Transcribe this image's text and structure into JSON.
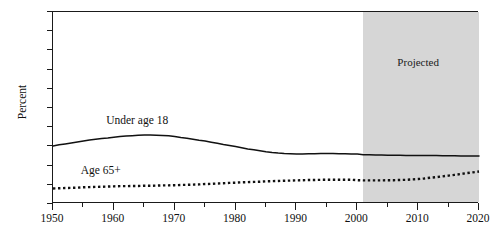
{
  "chart_data": {
    "type": "line",
    "title": "",
    "xlabel": "",
    "ylabel": "Percent",
    "xlim": [
      1950,
      2020
    ],
    "ylim": [
      0,
      100
    ],
    "grid": false,
    "legend_position": "inline-annotations",
    "xticks": [
      1950,
      1955,
      1960,
      1965,
      1970,
      1975,
      1980,
      1985,
      1990,
      1995,
      2000,
      2005,
      2010,
      2015,
      2020
    ],
    "xtick_labels": [
      "1950",
      "",
      "1960",
      "",
      "1970",
      "",
      "1980",
      "",
      "1990",
      "",
      "2000",
      "",
      "2010",
      "",
      "2020"
    ],
    "yticks": [
      0,
      10,
      20,
      30,
      40,
      50,
      60,
      70,
      80,
      90,
      100
    ],
    "ytick_labels": [
      "0",
      "10",
      "20",
      "30",
      "40",
      "50",
      "60",
      "70",
      "80",
      "90",
      "100"
    ],
    "annotations": [
      {
        "name": "projected-region",
        "label": "Projected",
        "x_start": 2001,
        "x_end": 2020,
        "label_x": 2010,
        "label_y": 74,
        "fill": "#d6d6d6"
      }
    ],
    "series": [
      {
        "name": "Under age 18",
        "style": "solid",
        "color": "#111111",
        "label_x": 1964,
        "label_y": 43,
        "x": [
          1950,
          1951,
          1952,
          1953,
          1954,
          1955,
          1956,
          1957,
          1958,
          1959,
          1960,
          1961,
          1962,
          1963,
          1964,
          1965,
          1966,
          1967,
          1968,
          1969,
          1970,
          1971,
          1972,
          1973,
          1974,
          1975,
          1976,
          1977,
          1978,
          1979,
          1980,
          1981,
          1982,
          1983,
          1984,
          1985,
          1986,
          1987,
          1988,
          1989,
          1990,
          1991,
          1992,
          1993,
          1994,
          1995,
          1996,
          1997,
          1998,
          1999,
          2000,
          2001,
          2002,
          2003,
          2004,
          2005,
          2006,
          2007,
          2008,
          2009,
          2010,
          2011,
          2012,
          2013,
          2014,
          2015,
          2016,
          2017,
          2018,
          2019,
          2020
        ],
        "values": [
          30.2,
          30.8,
          31.3,
          31.8,
          32.3,
          32.8,
          33.3,
          33.7,
          34.1,
          34.4,
          34.8,
          35.2,
          35.4,
          35.6,
          35.8,
          35.9,
          35.9,
          35.8,
          35.7,
          35.5,
          35.1,
          34.6,
          34.2,
          33.7,
          33.2,
          32.8,
          32.2,
          31.6,
          31.0,
          30.5,
          29.9,
          29.3,
          28.7,
          28.2,
          27.7,
          27.2,
          26.8,
          26.5,
          26.3,
          26.2,
          26.1,
          26.1,
          26.2,
          26.2,
          26.3,
          26.3,
          26.3,
          26.2,
          26.2,
          26.1,
          26.1,
          25.7,
          25.6,
          25.5,
          25.5,
          25.4,
          25.4,
          25.4,
          25.3,
          25.3,
          25.3,
          25.2,
          25.2,
          25.2,
          25.1,
          25.1,
          25.1,
          25.0,
          25.0,
          25.0,
          25.0
        ]
      },
      {
        "name": "Age 65+",
        "style": "dotted",
        "color": "#111111",
        "label_x": 1958,
        "label_y": 17,
        "x": [
          1950,
          1951,
          1952,
          1953,
          1954,
          1955,
          1956,
          1957,
          1958,
          1959,
          1960,
          1961,
          1962,
          1963,
          1964,
          1965,
          1966,
          1967,
          1968,
          1969,
          1970,
          1971,
          1972,
          1973,
          1974,
          1975,
          1976,
          1977,
          1978,
          1979,
          1980,
          1981,
          1982,
          1983,
          1984,
          1985,
          1986,
          1987,
          1988,
          1989,
          1990,
          1991,
          1992,
          1993,
          1994,
          1995,
          1996,
          1997,
          1998,
          1999,
          2000,
          2001,
          2002,
          2003,
          2004,
          2005,
          2006,
          2007,
          2008,
          2009,
          2010,
          2011,
          2012,
          2013,
          2014,
          2015,
          2016,
          2017,
          2018,
          2019,
          2020
        ],
        "values": [
          8.1,
          8.2,
          8.3,
          8.4,
          8.5,
          8.7,
          8.8,
          8.9,
          9.0,
          9.1,
          9.2,
          9.3,
          9.3,
          9.4,
          9.4,
          9.5,
          9.5,
          9.6,
          9.7,
          9.7,
          9.8,
          9.9,
          10.0,
          10.1,
          10.2,
          10.4,
          10.5,
          10.7,
          10.8,
          11.0,
          11.1,
          11.3,
          11.4,
          11.5,
          11.6,
          11.8,
          11.9,
          12.0,
          12.1,
          12.2,
          12.3,
          12.4,
          12.5,
          12.5,
          12.6,
          12.6,
          12.6,
          12.6,
          12.6,
          12.6,
          12.4,
          12.3,
          12.3,
          12.3,
          12.3,
          12.4,
          12.4,
          12.5,
          12.6,
          12.8,
          13.0,
          13.3,
          13.7,
          14.0,
          14.4,
          14.8,
          15.2,
          15.6,
          16.1,
          16.5,
          16.9
        ]
      }
    ]
  }
}
